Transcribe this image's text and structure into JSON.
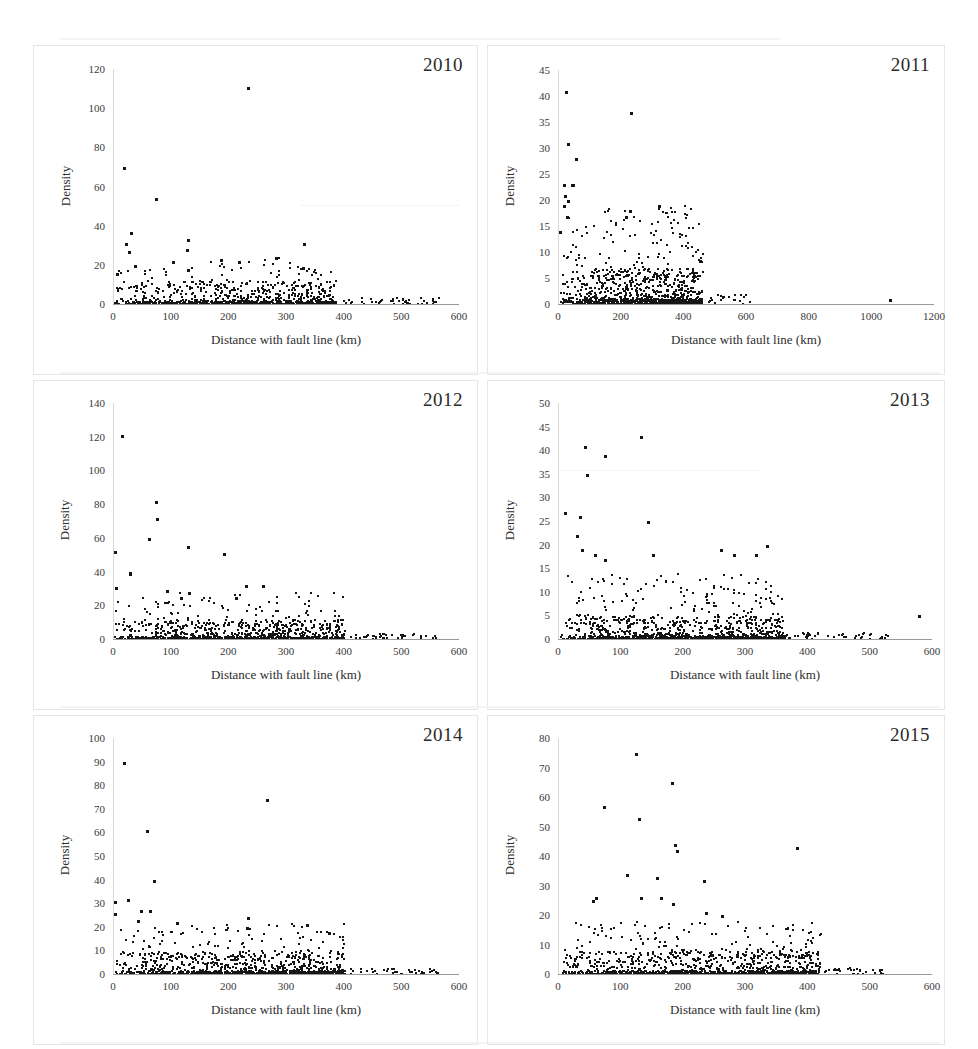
{
  "figure": {
    "axis_title_x": "Distance with fault line (km)",
    "axis_title_y": "Density",
    "point_color": "#151515",
    "frame_color": "#e6e6e6"
  },
  "chart_data": [
    {
      "type": "scatter",
      "title": "2010",
      "xlabel": "Distance with fault line (km)",
      "ylabel": "Density",
      "xlim": [
        0,
        600
      ],
      "ylim": [
        0,
        120
      ],
      "xticks": [
        0,
        100,
        200,
        300,
        400,
        500,
        600
      ],
      "yticks": [
        0,
        20,
        40,
        60,
        80,
        100,
        120
      ],
      "grid": false,
      "legend": "none",
      "n_points": 620,
      "notable_points": [
        {
          "x": 232,
          "y": 111
        },
        {
          "x": 18,
          "y": 70
        },
        {
          "x": 72,
          "y": 54
        },
        {
          "x": 29,
          "y": 37
        },
        {
          "x": 128,
          "y": 33
        },
        {
          "x": 330,
          "y": 31
        },
        {
          "x": 21,
          "y": 31
        },
        {
          "x": 127,
          "y": 28
        },
        {
          "x": 26,
          "y": 27
        },
        {
          "x": 281,
          "y": 24
        },
        {
          "x": 186,
          "y": 23
        },
        {
          "x": 217,
          "y": 22
        },
        {
          "x": 102,
          "y": 22
        },
        {
          "x": 36,
          "y": 20
        },
        {
          "x": 328,
          "y": 19
        },
        {
          "x": 129,
          "y": 18
        },
        {
          "x": 5,
          "y": 16
        }
      ],
      "description": "Dense band of points below density 12 from 0 to ~380 km, thinning to sparse single points out to ~570 km."
    },
    {
      "type": "scatter",
      "title": "2011",
      "xlabel": "Distance with fault line (km)",
      "ylabel": "Density",
      "xlim": [
        0,
        1200
      ],
      "ylim": [
        0,
        45
      ],
      "xticks": [
        0,
        200,
        400,
        600,
        800,
        1000,
        1200
      ],
      "yticks": [
        0,
        5,
        10,
        15,
        20,
        25,
        30,
        35,
        40,
        45
      ],
      "grid": false,
      "legend": "none",
      "n_points": 700,
      "notable_points": [
        {
          "x": 22,
          "y": 41
        },
        {
          "x": 230,
          "y": 37
        },
        {
          "x": 28,
          "y": 31
        },
        {
          "x": 54,
          "y": 28
        },
        {
          "x": 17,
          "y": 23
        },
        {
          "x": 42,
          "y": 23
        },
        {
          "x": 44,
          "y": 23
        },
        {
          "x": 20,
          "y": 21
        },
        {
          "x": 29,
          "y": 20
        },
        {
          "x": 16,
          "y": 19
        },
        {
          "x": 320,
          "y": 19
        },
        {
          "x": 25,
          "y": 17
        },
        {
          "x": 225,
          "y": 18
        },
        {
          "x": 213,
          "y": 17
        },
        {
          "x": 3,
          "y": 14
        },
        {
          "x": 1055,
          "y": 1
        }
      ],
      "description": "Very dense low band under density 7 from 0 to ~450 km; isolated far outlier near 1055 km at density 1."
    },
    {
      "type": "scatter",
      "title": "2012",
      "xlabel": "Distance with fault line (km)",
      "ylabel": "Density",
      "xlim": [
        0,
        600
      ],
      "ylim": [
        0,
        140
      ],
      "xticks": [
        0,
        100,
        200,
        300,
        400,
        500,
        600
      ],
      "yticks": [
        0,
        20,
        40,
        60,
        80,
        100,
        120,
        140
      ],
      "grid": false,
      "legend": "none",
      "n_points": 680,
      "notable_points": [
        {
          "x": 14,
          "y": 121
        },
        {
          "x": 72,
          "y": 82
        },
        {
          "x": 75,
          "y": 72
        },
        {
          "x": 60,
          "y": 60
        },
        {
          "x": 128,
          "y": 55
        },
        {
          "x": 1,
          "y": 52
        },
        {
          "x": 191,
          "y": 51
        },
        {
          "x": 27,
          "y": 40
        },
        {
          "x": 27,
          "y": 39
        },
        {
          "x": 4,
          "y": 31
        },
        {
          "x": 229,
          "y": 32
        },
        {
          "x": 258,
          "y": 32
        },
        {
          "x": 91,
          "y": 29
        },
        {
          "x": 130,
          "y": 28
        },
        {
          "x": 116,
          "y": 25
        },
        {
          "x": 212,
          "y": 25
        }
      ],
      "description": "Dense band below density 12 to ~400 km, scattered singletons out to ~560 km."
    },
    {
      "type": "scatter",
      "title": "2013",
      "xlabel": "Distance with fault line (km)",
      "ylabel": "Density",
      "xlim": [
        0,
        600
      ],
      "ylim": [
        0,
        50
      ],
      "xticks": [
        0,
        100,
        200,
        300,
        400,
        500,
        600
      ],
      "yticks": [
        0,
        5,
        10,
        15,
        20,
        25,
        30,
        35,
        40,
        45,
        50
      ],
      "grid": false,
      "legend": "none",
      "n_points": 720,
      "notable_points": [
        {
          "x": 131,
          "y": 43
        },
        {
          "x": 41,
          "y": 41
        },
        {
          "x": 73,
          "y": 39
        },
        {
          "x": 45,
          "y": 35
        },
        {
          "x": 10,
          "y": 27
        },
        {
          "x": 34,
          "y": 26
        },
        {
          "x": 143,
          "y": 25
        },
        {
          "x": 28,
          "y": 22
        },
        {
          "x": 37,
          "y": 19
        },
        {
          "x": 333,
          "y": 20
        },
        {
          "x": 260,
          "y": 19
        },
        {
          "x": 57,
          "y": 18
        },
        {
          "x": 150,
          "y": 18
        },
        {
          "x": 281,
          "y": 18
        },
        {
          "x": 316,
          "y": 18
        },
        {
          "x": 73,
          "y": 17
        },
        {
          "x": 578,
          "y": 5
        }
      ],
      "description": "Extremely dense low band under density 5 from 0 to ~350 km; a faint isolated point near 578 km at density 5."
    },
    {
      "type": "scatter",
      "title": "2014",
      "xlabel": "Distance with fault line (km)",
      "ylabel": "Density",
      "xlim": [
        0,
        600
      ],
      "ylim": [
        0,
        100
      ],
      "xticks": [
        0,
        100,
        200,
        300,
        400,
        500,
        600
      ],
      "yticks": [
        0,
        10,
        20,
        30,
        40,
        50,
        60,
        70,
        80,
        90,
        100
      ],
      "grid": false,
      "legend": "none",
      "n_points": 700,
      "notable_points": [
        {
          "x": 18,
          "y": 90
        },
        {
          "x": 265,
          "y": 74
        },
        {
          "x": 58,
          "y": 61
        },
        {
          "x": 70,
          "y": 40
        },
        {
          "x": 24,
          "y": 32
        },
        {
          "x": 1,
          "y": 31
        },
        {
          "x": 62,
          "y": 27
        },
        {
          "x": 47,
          "y": 27
        },
        {
          "x": 1,
          "y": 26
        },
        {
          "x": 232,
          "y": 24
        },
        {
          "x": 41,
          "y": 23
        },
        {
          "x": 110,
          "y": 22
        },
        {
          "x": 335,
          "y": 21
        },
        {
          "x": 230,
          "y": 20
        },
        {
          "x": 373,
          "y": 18
        },
        {
          "x": 560,
          "y": 1
        }
      ],
      "description": "Dense band under density 10 from 0 to ~400 km, isolated point near 560 km."
    },
    {
      "type": "scatter",
      "title": "2015",
      "xlabel": "Distance with fault line (km)",
      "ylabel": "Density",
      "xlim": [
        0,
        600
      ],
      "ylim": [
        0,
        80
      ],
      "xticks": [
        0,
        100,
        200,
        300,
        400,
        500,
        600
      ],
      "yticks": [
        0,
        10,
        20,
        30,
        40,
        50,
        60,
        70,
        80
      ],
      "grid": false,
      "legend": "none",
      "n_points": 760,
      "notable_points": [
        {
          "x": 124,
          "y": 75
        },
        {
          "x": 181,
          "y": 65
        },
        {
          "x": 72,
          "y": 57
        },
        {
          "x": 128,
          "y": 53
        },
        {
          "x": 186,
          "y": 44
        },
        {
          "x": 381,
          "y": 43
        },
        {
          "x": 190,
          "y": 42
        },
        {
          "x": 109,
          "y": 34
        },
        {
          "x": 157,
          "y": 33
        },
        {
          "x": 232,
          "y": 32
        },
        {
          "x": 60,
          "y": 26
        },
        {
          "x": 132,
          "y": 26
        },
        {
          "x": 164,
          "y": 26
        },
        {
          "x": 55,
          "y": 25
        },
        {
          "x": 183,
          "y": 24
        },
        {
          "x": 236,
          "y": 21
        },
        {
          "x": 261,
          "y": 20
        }
      ],
      "description": "Dense band under density 8 from 0 to ~420 km with a scatter of mid-range peaks between 50 and 250 km."
    }
  ]
}
